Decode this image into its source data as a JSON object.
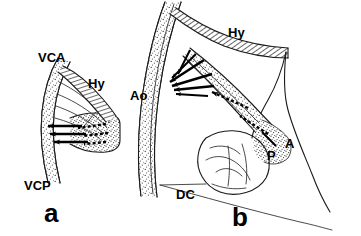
{
  "figure": {
    "background_color": "#ffffff",
    "ink_color": "#000000",
    "width": 361,
    "height": 236,
    "style": "pen-and-ink anatomical schematic with stippled tissue, hatched cartilage and directional flow arrows"
  },
  "panels": [
    {
      "id": "a",
      "label": "a",
      "label_position": {
        "x": 44,
        "y": 222
      },
      "description": "Left panel: anterior and posterior vena cava converging near the hypophysis-hatched structure with flow arrows",
      "labels": [
        {
          "name": "vca",
          "text": "VCA",
          "x": 38,
          "y": 62,
          "meaning": "vena cava anterior"
        },
        {
          "name": "hy",
          "text": "Hy",
          "x": 88,
          "y": 88,
          "meaning": "hyoid / hatched cartilaginous band"
        },
        {
          "name": "vcp",
          "text": "VCP",
          "x": 24,
          "y": 190,
          "meaning": "vena cava posterior"
        }
      ]
    },
    {
      "id": "b",
      "label": "b",
      "label_position": {
        "x": 232,
        "y": 226
      },
      "description": "Right panel: aortic arch region with hyoid hatched band, pulmonary and arterial structures, diaphragm-cupola line",
      "labels": [
        {
          "name": "hy",
          "text": "Hy",
          "x": 228,
          "y": 37,
          "meaning": "hyoid / hatched cartilaginous band"
        },
        {
          "name": "ao",
          "text": "Ao",
          "x": 130,
          "y": 100,
          "meaning": "aorta"
        },
        {
          "name": "a",
          "text": "A",
          "x": 285,
          "y": 148,
          "meaning": "atrium / artery"
        },
        {
          "name": "p",
          "text": "P",
          "x": 267,
          "y": 160,
          "meaning": "pulmonary"
        },
        {
          "name": "dc",
          "text": "DC",
          "x": 176,
          "y": 199,
          "meaning": "diaphragmatic cupola"
        }
      ]
    }
  ],
  "legend_notes": {
    "solid_arrows": "solid black arrows indicate direction of blood flow",
    "dashed_arrows": "dashed black arrows indicate secondary or collateral flow",
    "stipple": "stippled areas denote vessel wall / soft tissue",
    "hatching": "diagonal hatching denotes cartilage"
  }
}
